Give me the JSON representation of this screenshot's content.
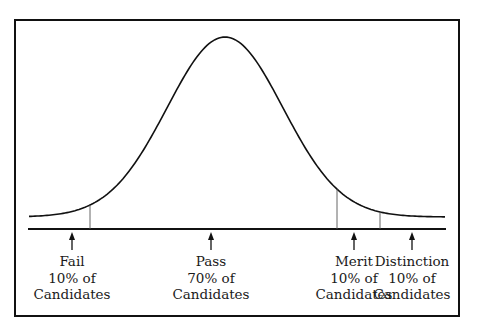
{
  "chart_data": {
    "type": "normal-distribution-diagram",
    "title": "",
    "curve": {
      "center_x": 225,
      "peak_y": 37,
      "tail_y": 217,
      "sigma_px": 58
    },
    "dividers_x": [
      90,
      337,
      380
    ],
    "categories": [
      {
        "name": "Fail",
        "percent": "10% of",
        "unit": "Candidates",
        "arrow_x": 72
      },
      {
        "name": "Pass",
        "percent": "70% of",
        "unit": "Candidates",
        "arrow_x": 211
      },
      {
        "name": "Merit",
        "percent": "10% of",
        "unit": "Candidates",
        "arrow_x": 354
      },
      {
        "name": "Distinction",
        "percent": "10% of",
        "unit": "Candidates",
        "arrow_x": 412
      }
    ],
    "values": [
      10,
      70,
      10,
      10
    ]
  },
  "labels": [
    {
      "line1": "Fail",
      "line2": "10% of",
      "line3": "Candidates"
    },
    {
      "line1": "Pass",
      "line2": "70% of",
      "line3": "Candidates"
    },
    {
      "line1": "Merit",
      "line2": "10% of",
      "line3": "Candidates"
    },
    {
      "line1": "Distinction",
      "line2": "10% of",
      "line3": "Candidates"
    }
  ],
  "colors": {
    "line": "#111111",
    "divider": "#555555",
    "background": "#ffffff"
  }
}
